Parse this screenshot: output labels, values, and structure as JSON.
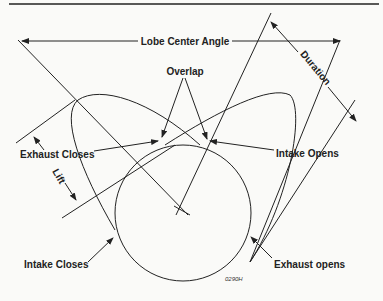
{
  "diagram": {
    "labels": {
      "lobe_center_angle": "Lobe Center Angle",
      "overlap": "Overlap",
      "duration": "Duration",
      "exhaust_closes": "Exhaust Closes",
      "lift": "Lift",
      "intake_opens": "Intake Opens",
      "intake_closes": "Intake Closes",
      "exhaust_opens": "Exhaust opens",
      "figure_code": "0290H"
    },
    "colors": {
      "background": "#fafaf8",
      "ink": "#222222"
    }
  }
}
